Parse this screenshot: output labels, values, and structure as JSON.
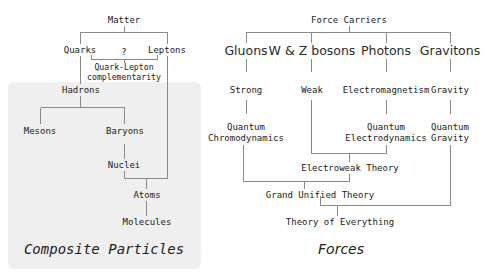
{
  "composite": {
    "title": "Composite Particles",
    "root": "Matter",
    "quarks": "Quarks",
    "leptons": "Leptons",
    "unknown": "?",
    "complementarity_line1": "Quark-Lepton",
    "complementarity_line2": "complementarity",
    "hadrons": "Hadrons",
    "mesons": "Mesons",
    "baryons": "Baryons",
    "nuclei": "Nuclei",
    "atoms": "Atoms",
    "molecules": "Molecules"
  },
  "forces": {
    "title": "Forces",
    "root": "Force Carriers",
    "carriers": [
      "Gluons",
      "W & Z bosons",
      "Photons",
      "Gravitons"
    ],
    "interactions": [
      "Strong",
      "Weak",
      "Electromagnetism",
      "Gravity"
    ],
    "qcd_line1": "Quantum",
    "qcd_line2": "Chromodynamics",
    "qed_line1": "Quantum",
    "qed_line2": "Electrodynamics",
    "qg_line1": "Quantum",
    "qg_line2": "Gravity",
    "electroweak": "Electroweak Theory",
    "gut": "Grand Unified Theory",
    "toe": "Theory of Everything"
  },
  "colors": {
    "panel_bg": "#efefef",
    "line": "#8a8a8a",
    "text": "#1a1a1a"
  }
}
